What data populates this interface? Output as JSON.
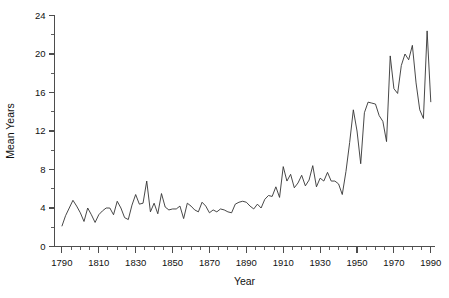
{
  "chart_data": {
    "type": "line",
    "title": "",
    "xlabel": "Year",
    "ylabel": "Mean Years",
    "xlim": [
      1786,
      1992
    ],
    "ylim": [
      0,
      24
    ],
    "grid": false,
    "legend": null,
    "x_major_ticks": [
      1790,
      1810,
      1830,
      1850,
      1870,
      1890,
      1910,
      1930,
      1950,
      1970,
      1990
    ],
    "x_tick_labels": [
      "1790",
      "1810",
      "1830",
      "1850",
      "1870",
      "1890",
      "1910",
      "1930",
      "1950",
      "1970",
      "1990"
    ],
    "x_minor_tick_step": 5,
    "y_major_ticks": [
      0,
      4,
      8,
      12,
      16,
      20,
      24
    ],
    "y_tick_labels": [
      "0",
      "4",
      "8",
      "12",
      "16",
      "20",
      "24"
    ],
    "y_minor_tick_step": 2,
    "series": [
      {
        "name": "Mean Years",
        "x": [
          1790,
          1792,
          1794,
          1796,
          1798,
          1800,
          1802,
          1804,
          1806,
          1808,
          1810,
          1812,
          1814,
          1816,
          1818,
          1820,
          1822,
          1824,
          1826,
          1828,
          1830,
          1832,
          1834,
          1836,
          1838,
          1840,
          1842,
          1844,
          1846,
          1848,
          1850,
          1852,
          1854,
          1856,
          1858,
          1860,
          1862,
          1864,
          1866,
          1868,
          1870,
          1872,
          1874,
          1876,
          1878,
          1880,
          1882,
          1884,
          1886,
          1888,
          1890,
          1892,
          1894,
          1896,
          1898,
          1900,
          1902,
          1904,
          1906,
          1908,
          1910,
          1912,
          1914,
          1916,
          1918,
          1920,
          1922,
          1924,
          1926,
          1928,
          1930,
          1932,
          1934,
          1936,
          1938,
          1940,
          1942,
          1944,
          1946,
          1948,
          1950,
          1952,
          1954,
          1956,
          1958,
          1960,
          1962,
          1964,
          1966,
          1968,
          1970,
          1972,
          1974,
          1976,
          1978,
          1980,
          1982,
          1984,
          1986,
          1988,
          1990
        ],
        "values": [
          2.1,
          3.2,
          4.0,
          4.8,
          4.2,
          3.5,
          2.6,
          4.0,
          3.3,
          2.5,
          3.3,
          3.7,
          4.0,
          4.0,
          3.3,
          4.7,
          4.0,
          3.0,
          2.8,
          4.3,
          5.4,
          4.4,
          4.5,
          6.8,
          3.6,
          4.5,
          3.4,
          5.5,
          4.1,
          3.8,
          3.9,
          3.9,
          4.2,
          2.9,
          4.5,
          4.2,
          3.8,
          3.6,
          4.6,
          4.2,
          3.5,
          3.8,
          3.6,
          3.9,
          3.8,
          3.6,
          3.5,
          4.4,
          4.6,
          4.7,
          4.6,
          4.2,
          3.9,
          4.4,
          4.0,
          4.9,
          5.3,
          5.2,
          6.2,
          5.1,
          8.3,
          6.8,
          7.5,
          6.1,
          6.6,
          7.4,
          6.3,
          6.9,
          8.4,
          6.2,
          7.1,
          6.8,
          7.7,
          6.8,
          6.8,
          6.5,
          5.4,
          7.8,
          10.8,
          14.2,
          12.0,
          8.6,
          13.9,
          15.0,
          14.9,
          14.8,
          13.6,
          13.0,
          10.9,
          19.8,
          16.4,
          15.9,
          18.8,
          20.0,
          19.4,
          20.9,
          17.0,
          14.2,
          13.3,
          22.4,
          15.0
        ]
      }
    ]
  },
  "axes": {
    "ylabel_text": "Mean Years",
    "xlabel_text": "Year"
  }
}
